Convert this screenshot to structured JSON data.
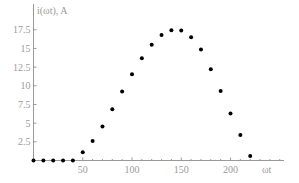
{
  "chart_data": {
    "type": "scatter",
    "title": "",
    "xlabel": "ωt",
    "ylabel": "i(ωt), A",
    "xlim": [
      0,
      255
    ],
    "ylim": [
      0,
      20
    ],
    "grid": false,
    "legend": null,
    "x_ticks": [
      50,
      100,
      150,
      200
    ],
    "x_tick_labels": [
      "50",
      "100",
      "150",
      "200"
    ],
    "y_ticks": [
      2.5,
      5,
      7.5,
      10,
      12.5,
      15,
      17.5
    ],
    "y_tick_labels": [
      "2.5",
      "5",
      "7.5",
      "10",
      "12.5",
      "15",
      "17.5"
    ],
    "series": [
      {
        "name": "i(ωt)",
        "color": "#000000",
        "x": [
          0,
          10,
          20,
          30,
          40,
          50,
          60,
          70,
          80,
          90,
          100,
          110,
          120,
          130,
          140,
          150,
          160,
          170,
          180,
          190,
          200,
          210,
          220
        ],
        "values": [
          0,
          0,
          0,
          0,
          0,
          1.1,
          2.6,
          4.55,
          6.85,
          9.25,
          11.55,
          13.7,
          15.5,
          16.8,
          17.45,
          17.4,
          16.5,
          14.85,
          12.2,
          9.3,
          6.3,
          3.4,
          0.6
        ]
      }
    ]
  },
  "axes": {
    "x_label": "ωt",
    "y_label": "i(ωt), A",
    "axis_color": "#9a9a9a",
    "point_color": "#000000"
  }
}
